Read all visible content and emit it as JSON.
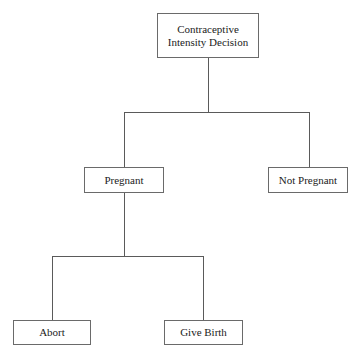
{
  "diagram": {
    "type": "decision-tree",
    "nodes": {
      "root": {
        "label_line1": "Contraceptive",
        "label_line2": "Intensity Decision"
      },
      "pregnant": {
        "label": "Pregnant"
      },
      "not_pregnant": {
        "label": "Not Pregnant"
      },
      "abort": {
        "label": "Abort"
      },
      "give_birth": {
        "label": "Give Birth"
      }
    },
    "edges": [
      {
        "from": "root",
        "to": "pregnant"
      },
      {
        "from": "root",
        "to": "not_pregnant"
      },
      {
        "from": "pregnant",
        "to": "abort"
      },
      {
        "from": "pregnant",
        "to": "give_birth"
      }
    ]
  }
}
